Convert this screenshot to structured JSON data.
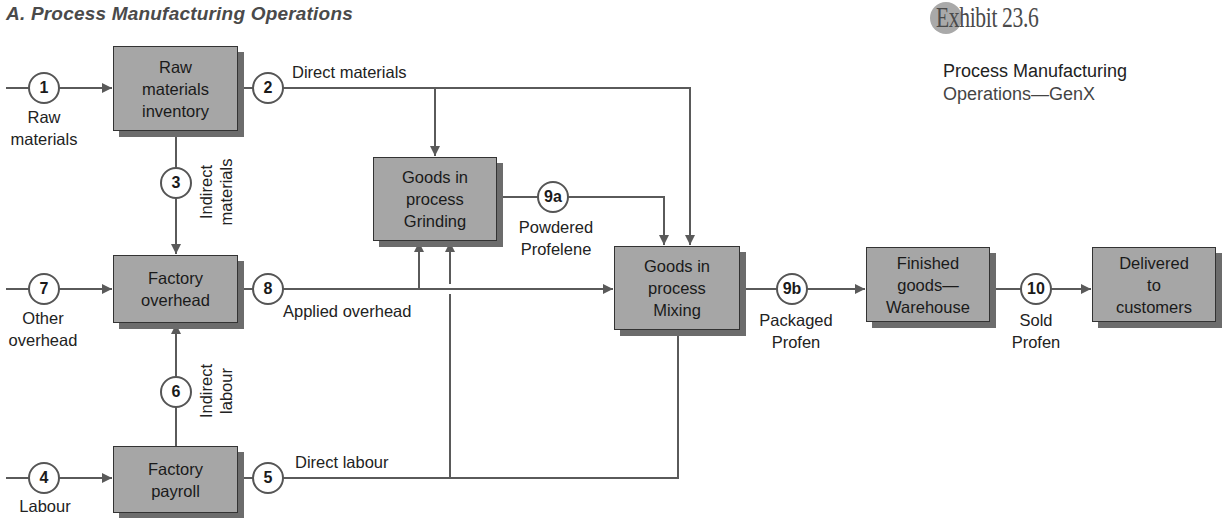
{
  "header": {
    "section_title": "A. Process Manufacturing Operations",
    "exhibit_label": "Exhibit 23.6",
    "subtitle_line1": "Process Manufacturing",
    "subtitle_line2": "Operations—GenX"
  },
  "colors": {
    "box_fill": "#a6a6a6",
    "box_shadow": "#6c6c6c",
    "line": "#5a5a5a",
    "exhibit_dot": "#a9a9a9"
  },
  "boxes": {
    "raw_materials_inventory": [
      "Raw",
      "materials",
      "inventory"
    ],
    "factory_overhead": [
      "Factory",
      "overhead"
    ],
    "factory_payroll": [
      "Factory",
      "payroll"
    ],
    "goods_in_process_grinding": [
      "Goods in",
      "process",
      "Grinding"
    ],
    "goods_in_process_mixing": [
      "Goods in",
      "process",
      "Mixing"
    ],
    "finished_goods_warehouse": [
      "Finished",
      "goods—",
      "Warehouse"
    ],
    "delivered_to_customers": [
      "Delivered",
      "to",
      "customers"
    ]
  },
  "steps": {
    "s1": "1",
    "s2": "2",
    "s3": "3",
    "s4": "4",
    "s5": "5",
    "s6": "6",
    "s7": "7",
    "s8": "8",
    "s9a": "9a",
    "s9b": "9b",
    "s10": "10"
  },
  "flow_labels": {
    "raw_materials": [
      "Raw",
      "materials"
    ],
    "direct_materials": "Direct materials",
    "indirect_materials": [
      "Indirect",
      "materials"
    ],
    "other_overhead": [
      "Other",
      "overhead"
    ],
    "applied_overhead": "Applied overhead",
    "indirect_labour": [
      "Indirect",
      "labour"
    ],
    "labour": "Labour",
    "direct_labour": "Direct labour",
    "powdered_profelene": [
      "Powdered",
      "Profelene"
    ],
    "packaged_profen": [
      "Packaged",
      "Profen"
    ],
    "sold_profen": [
      "Sold",
      "Profen"
    ]
  }
}
